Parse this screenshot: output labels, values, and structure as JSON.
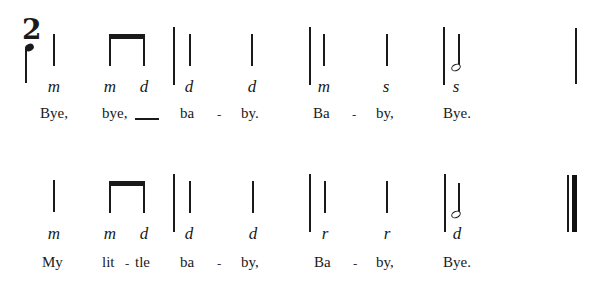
{
  "time_signature": {
    "top": "2",
    "bottom_note": "quarter-note"
  },
  "line1": {
    "solfa": [
      "m",
      "m",
      "d",
      "d",
      "d",
      "m",
      "s",
      "s"
    ],
    "lyrics": {
      "w1": "Bye,",
      "w2": "bye,",
      "w3": "ba",
      "w4": "by.",
      "w5": "Ba",
      "w6": "by,",
      "w7": "Bye."
    },
    "hyphen": "-"
  },
  "line2": {
    "solfa": [
      "m",
      "m",
      "d",
      "d",
      "d",
      "r",
      "r",
      "d"
    ],
    "lyrics": {
      "w1": "My",
      "w2": "lit",
      "w3": "tle",
      "w4": "ba",
      "w5": "by,",
      "w6": "Ba",
      "w7": "by,",
      "w8": "Bye."
    },
    "hyphen": "-"
  }
}
